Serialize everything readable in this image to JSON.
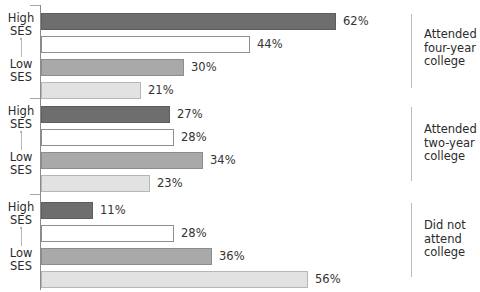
{
  "chart": {
    "title_remnant": "",
    "axis": {
      "high_label": "High\nSES",
      "low_label": "Low\nSES"
    }
  },
  "chart_data": {
    "type": "bar",
    "orientation": "horizontal",
    "title": "",
    "xlabel": "",
    "ylabel": "",
    "xlim": [
      0,
      62
    ],
    "grid": false,
    "legend_position": "none",
    "value_suffix": "%",
    "categories": [
      "Attended\nfour-year\ncollege",
      "Attended\ntwo-year\ncollege",
      "Did not\nattend\ncollege"
    ],
    "series": [
      {
        "name": "High SES",
        "style": "dark",
        "values": [
          62,
          27,
          11
        ]
      },
      {
        "name": "2nd",
        "style": "white",
        "values": [
          44,
          28,
          28
        ]
      },
      {
        "name": "3rd",
        "style": "mid",
        "values": [
          30,
          34,
          36
        ]
      },
      {
        "name": "Low SES",
        "style": "light",
        "values": [
          21,
          23,
          56
        ]
      }
    ],
    "groups": [
      {
        "label": "Attended\nfour-year\ncollege",
        "high_label": "High\nSES",
        "low_label": "Low\nSES",
        "bars": [
          {
            "value": 62,
            "display": "62%",
            "style": "dark"
          },
          {
            "value": 44,
            "display": "44%",
            "style": "white"
          },
          {
            "value": 30,
            "display": "30%",
            "style": "mid"
          },
          {
            "value": 21,
            "display": "21%",
            "style": "light"
          }
        ]
      },
      {
        "label": "Attended\ntwo-year\ncollege",
        "high_label": "High\nSES",
        "low_label": "Low\nSES",
        "bars": [
          {
            "value": 27,
            "display": "27%",
            "style": "dark"
          },
          {
            "value": 28,
            "display": "28%",
            "style": "white"
          },
          {
            "value": 34,
            "display": "34%",
            "style": "mid"
          },
          {
            "value": 23,
            "display": "23%",
            "style": "light"
          }
        ]
      },
      {
        "label": "Did not\nattend\ncollege",
        "high_label": "High\nSES",
        "low_label": "Low\nSES",
        "bars": [
          {
            "value": 11,
            "display": "11%",
            "style": "dark"
          },
          {
            "value": 28,
            "display": "28%",
            "style": "white"
          },
          {
            "value": 36,
            "display": "36%",
            "style": "mid"
          },
          {
            "value": 56,
            "display": "56%",
            "style": "light"
          }
        ]
      }
    ],
    "colors": {
      "dark": "#6e6e6e",
      "white": "#ffffff",
      "mid": "#a9a9a9",
      "light": "#e2e2e2",
      "axis": "#8a8a8a",
      "text": "#2b2b2b"
    }
  }
}
